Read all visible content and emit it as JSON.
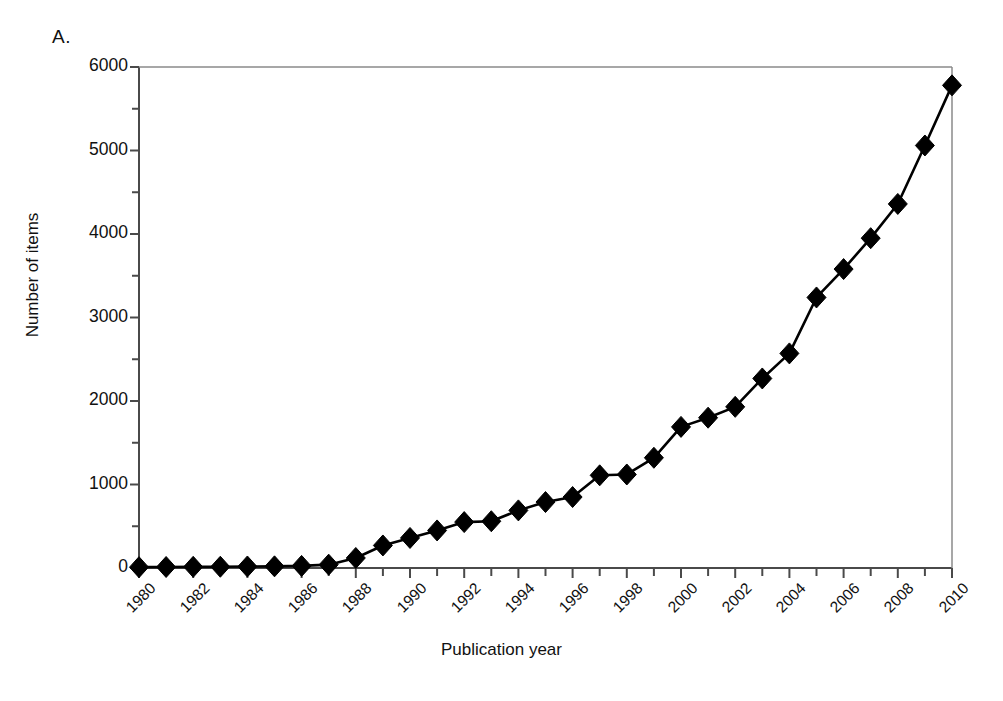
{
  "figure": {
    "panel_label": "A.",
    "xlabel": "Publication year",
    "ylabel": "Number of items"
  },
  "chart_data": {
    "type": "line",
    "title": "",
    "subtitle": "",
    "panel": "A.",
    "xlabel": "Publication year",
    "ylabel": "Number of items",
    "xlim": [
      1980,
      2010
    ],
    "ylim": [
      0,
      6000
    ],
    "grid": false,
    "legend": null,
    "marker": "diamond",
    "line_color": "#000000",
    "marker_color": "#000000",
    "y_major_ticks": [
      0,
      1000,
      2000,
      3000,
      4000,
      5000,
      6000
    ],
    "y_tick_labels": [
      "0",
      "1000",
      "2000",
      "3000",
      "4000",
      "5000",
      "6000"
    ],
    "y_minor_tick_step": 500,
    "x_major_ticks": [
      1980,
      1982,
      1984,
      1986,
      1988,
      1990,
      1992,
      1994,
      1996,
      1998,
      2000,
      2002,
      2004,
      2006,
      2008,
      2010
    ],
    "x_tick_labels": [
      "1980",
      "1982",
      "1984",
      "1986",
      "1988",
      "1990",
      "1992",
      "1994",
      "1996",
      "1998",
      "2000",
      "2002",
      "2004",
      "2006",
      "2008",
      "2010"
    ],
    "x_minor_tick_step": 1,
    "x": [
      1980,
      1981,
      1982,
      1983,
      1984,
      1985,
      1986,
      1987,
      1988,
      1989,
      1990,
      1991,
      1992,
      1993,
      1994,
      1995,
      1996,
      1997,
      1998,
      1999,
      2000,
      2001,
      2002,
      2003,
      2004,
      2005,
      2006,
      2007,
      2008,
      2009,
      2010
    ],
    "values": [
      10,
      12,
      14,
      15,
      18,
      20,
      25,
      40,
      120,
      270,
      360,
      450,
      550,
      560,
      690,
      790,
      850,
      1110,
      1120,
      1320,
      1690,
      1800,
      1930,
      2270,
      2570,
      3240,
      3580,
      3950,
      4360,
      5060,
      5780
    ],
    "series": [
      {
        "name": "Number of items",
        "values": [
          10,
          12,
          14,
          15,
          18,
          20,
          25,
          40,
          120,
          270,
          360,
          450,
          550,
          560,
          690,
          790,
          850,
          1110,
          1120,
          1320,
          1690,
          1800,
          1930,
          2270,
          2570,
          3240,
          3580,
          3950,
          4360,
          5060,
          5780
        ]
      }
    ]
  }
}
